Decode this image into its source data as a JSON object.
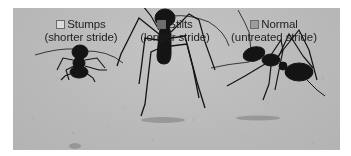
{
  "figure": {
    "legend": [
      {
        "label": "Stumps",
        "sublabel": "(shorter stride)",
        "swatch_color": "#dcdcdc"
      },
      {
        "label": "Stilts",
        "sublabel": "(longer stride)",
        "swatch_color": "#6e6e6e"
      },
      {
        "label": "Normal",
        "sublabel": "(untreated stride)",
        "swatch_color": "#9c9c9c"
      }
    ],
    "colors": {
      "sand": "#bcbcbc",
      "ant": "#141414",
      "border": "#ffffff"
    }
  }
}
